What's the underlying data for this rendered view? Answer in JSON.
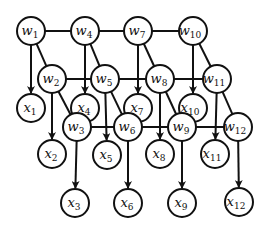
{
  "diagram": {
    "type": "graphical-model",
    "node_radius": 14,
    "stroke_color": "#111111",
    "background": "#ffffff",
    "nodes": [
      {
        "id": "w1",
        "base": "w",
        "sub": "1",
        "x": 31,
        "y": 31
      },
      {
        "id": "w4",
        "base": "w",
        "sub": "4",
        "x": 85,
        "y": 31
      },
      {
        "id": "w7",
        "base": "w",
        "sub": "7",
        "x": 138,
        "y": 31
      },
      {
        "id": "w10",
        "base": "w",
        "sub": "10",
        "x": 193,
        "y": 31
      },
      {
        "id": "w2",
        "base": "w",
        "sub": "2",
        "x": 52,
        "y": 79
      },
      {
        "id": "w5",
        "base": "w",
        "sub": "5",
        "x": 105,
        "y": 79
      },
      {
        "id": "w8",
        "base": "w",
        "sub": "8",
        "x": 160,
        "y": 79
      },
      {
        "id": "w11",
        "base": "w",
        "sub": "11",
        "x": 217,
        "y": 79
      },
      {
        "id": "x1",
        "base": "x",
        "sub": "1",
        "x": 31,
        "y": 108
      },
      {
        "id": "x4",
        "base": "x",
        "sub": "4",
        "x": 85,
        "y": 108
      },
      {
        "id": "x7",
        "base": "x",
        "sub": "7",
        "x": 138,
        "y": 108
      },
      {
        "id": "x10",
        "base": "x",
        "sub": "10",
        "x": 193,
        "y": 108
      },
      {
        "id": "w3",
        "base": "w",
        "sub": "3",
        "x": 77,
        "y": 127
      },
      {
        "id": "w6",
        "base": "w",
        "sub": "6",
        "x": 128,
        "y": 127
      },
      {
        "id": "w9",
        "base": "w",
        "sub": "9",
        "x": 182,
        "y": 127
      },
      {
        "id": "w12",
        "base": "w",
        "sub": "12",
        "x": 238,
        "y": 127
      },
      {
        "id": "x2",
        "base": "x",
        "sub": "2",
        "x": 52,
        "y": 154
      },
      {
        "id": "x5",
        "base": "x",
        "sub": "5",
        "x": 107,
        "y": 155
      },
      {
        "id": "x8",
        "base": "x",
        "sub": "8",
        "x": 160,
        "y": 154
      },
      {
        "id": "x11",
        "base": "x",
        "sub": "11",
        "x": 215,
        "y": 154
      },
      {
        "id": "x3",
        "base": "x",
        "sub": "3",
        "x": 75,
        "y": 203
      },
      {
        "id": "x6",
        "base": "x",
        "sub": "6",
        "x": 128,
        "y": 203
      },
      {
        "id": "x9",
        "base": "x",
        "sub": "9",
        "x": 182,
        "y": 203
      },
      {
        "id": "x12",
        "base": "x",
        "sub": "12",
        "x": 239,
        "y": 202
      }
    ],
    "edges": [
      {
        "from": "w1",
        "to": "w4",
        "directed": false
      },
      {
        "from": "w4",
        "to": "w7",
        "directed": false
      },
      {
        "from": "w7",
        "to": "w10",
        "directed": false
      },
      {
        "from": "w2",
        "to": "w5",
        "directed": false
      },
      {
        "from": "w5",
        "to": "w8",
        "directed": false
      },
      {
        "from": "w8",
        "to": "w11",
        "directed": false
      },
      {
        "from": "w3",
        "to": "w6",
        "directed": false
      },
      {
        "from": "w6",
        "to": "w9",
        "directed": false
      },
      {
        "from": "w9",
        "to": "w12",
        "directed": false
      },
      {
        "from": "w1",
        "to": "w2",
        "directed": false
      },
      {
        "from": "w2",
        "to": "w3",
        "directed": false
      },
      {
        "from": "w4",
        "to": "w5",
        "directed": false
      },
      {
        "from": "w5",
        "to": "w6",
        "directed": false
      },
      {
        "from": "w7",
        "to": "w8",
        "directed": false
      },
      {
        "from": "w8",
        "to": "w9",
        "directed": false
      },
      {
        "from": "w10",
        "to": "w11",
        "directed": false
      },
      {
        "from": "w11",
        "to": "w12",
        "directed": false
      },
      {
        "from": "w1",
        "to": "x1",
        "directed": true
      },
      {
        "from": "w2",
        "to": "x2",
        "directed": true
      },
      {
        "from": "w3",
        "to": "x3",
        "directed": true
      },
      {
        "from": "w4",
        "to": "x4",
        "directed": true
      },
      {
        "from": "w5",
        "to": "x5",
        "directed": true
      },
      {
        "from": "w6",
        "to": "x6",
        "directed": true
      },
      {
        "from": "w7",
        "to": "x7",
        "directed": true
      },
      {
        "from": "w8",
        "to": "x8",
        "directed": true
      },
      {
        "from": "w9",
        "to": "x9",
        "directed": true
      },
      {
        "from": "w10",
        "to": "x10",
        "directed": true
      },
      {
        "from": "w11",
        "to": "x11",
        "directed": true
      },
      {
        "from": "w12",
        "to": "x12",
        "directed": true
      }
    ]
  }
}
